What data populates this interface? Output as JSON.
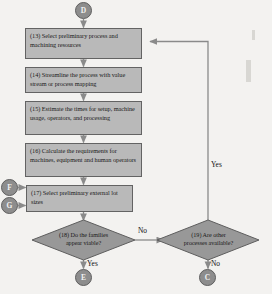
{
  "diagram": {
    "type": "flowchart",
    "colors": {
      "background": "#f3f2f0",
      "box_fill": "#b9b9b9",
      "box_stroke": "#636363",
      "diamond_fill": "#989898",
      "diamond_stroke": "#5e5e5e",
      "connector_fill": "#8d8d8d",
      "connector_text": "#f2f2f2",
      "line": "#8a8a8a",
      "text": "#1a1a1a"
    }
  },
  "connectors": {
    "start": {
      "label": "D",
      "name": "connector-d"
    },
    "in_f": {
      "label": "F",
      "name": "connector-f"
    },
    "in_g": {
      "label": "G",
      "name": "connector-g"
    },
    "out_e": {
      "label": "E",
      "name": "connector-e"
    },
    "out_c": {
      "label": "C",
      "name": "connector-c"
    }
  },
  "steps": [
    {
      "id": "13",
      "name": "step-13",
      "text": "(13) Select preliminary process and machining resources"
    },
    {
      "id": "14",
      "name": "step-14",
      "text": "(14) Streamline the process with value stream or process mapping"
    },
    {
      "id": "15",
      "name": "step-15",
      "text": "(15) Estimate the times for setup, machine usage, operators, and processing"
    },
    {
      "id": "16",
      "name": "step-16",
      "text": "(16) Calculate the requirements for machines, equipment and human operators"
    },
    {
      "id": "17",
      "name": "step-17",
      "text": "(17) Select preliminary external lot sizes"
    }
  ],
  "decisions": [
    {
      "id": "18",
      "name": "decision-18",
      "line1": "(18) Do the families",
      "line2": "appear viable?"
    },
    {
      "id": "19",
      "name": "decision-19",
      "line1": "(19) Are other",
      "line2": "processes available?"
    }
  ],
  "edge_labels": {
    "d18_no": "No",
    "d18_yes": "Yes",
    "d19_yes": "Yes",
    "d19_no": "No"
  }
}
